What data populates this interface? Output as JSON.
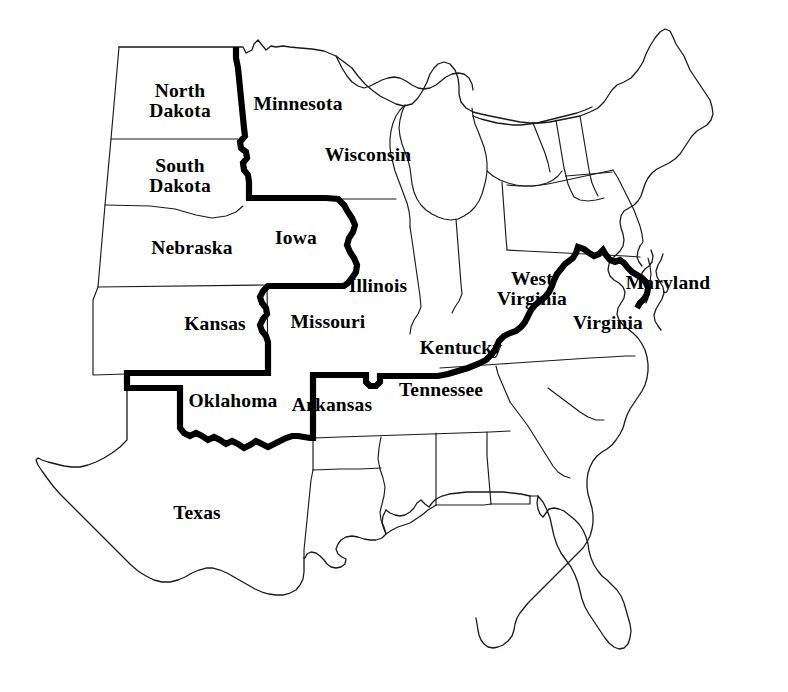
{
  "map": {
    "title": "United States map with bold sectional boundary",
    "description": "Outline map of the eastern and central United States with a heavy black line marking the boundary between the northern and southern states",
    "background_color": "#ffffff",
    "outline_color": "#1a1a1a",
    "bold_line_color": "#000000",
    "bold_line_label": "sectional boundary line",
    "labels": [
      {
        "id": "north-dakota",
        "name": "North Dakota",
        "lines": [
          "North",
          "Dakota"
        ],
        "x": 180,
        "y": 100
      },
      {
        "id": "minnesota",
        "name": "Minnesota",
        "lines": [
          "Minnesota"
        ],
        "x": 298,
        "y": 104
      },
      {
        "id": "south-dakota",
        "name": "South Dakota",
        "lines": [
          "South",
          "Dakota"
        ],
        "x": 180,
        "y": 175
      },
      {
        "id": "wisconsin",
        "name": "Wisconsin",
        "lines": [
          "Wisconsin"
        ],
        "x": 368,
        "y": 155
      },
      {
        "id": "nebraska",
        "name": "Nebraska",
        "lines": [
          "Nebraska"
        ],
        "x": 192,
        "y": 248
      },
      {
        "id": "iowa",
        "name": "Iowa",
        "lines": [
          "Iowa"
        ],
        "x": 296,
        "y": 238
      },
      {
        "id": "illinois",
        "name": "Illinois",
        "lines": [
          "Illinois"
        ],
        "x": 378,
        "y": 286
      },
      {
        "id": "west-virginia",
        "name": "West Virginia",
        "lines": [
          "West",
          "Virginia"
        ],
        "x": 532,
        "y": 288
      },
      {
        "id": "maryland",
        "name": "Maryland",
        "lines": [
          "Maryland"
        ],
        "x": 668,
        "y": 283
      },
      {
        "id": "kansas",
        "name": "Kansas",
        "lines": [
          "Kansas"
        ],
        "x": 215,
        "y": 324
      },
      {
        "id": "missouri",
        "name": "Missouri",
        "lines": [
          "Missouri"
        ],
        "x": 328,
        "y": 322
      },
      {
        "id": "virginia",
        "name": "Virginia",
        "lines": [
          "Virginia"
        ],
        "x": 608,
        "y": 323
      },
      {
        "id": "kentucky",
        "name": "Kentucky",
        "lines": [
          "Kentucky"
        ],
        "x": 461,
        "y": 348
      },
      {
        "id": "oklahoma",
        "name": "Oklahoma",
        "lines": [
          "Oklahoma"
        ],
        "x": 233,
        "y": 401
      },
      {
        "id": "arkansas",
        "name": "Arkansas",
        "lines": [
          "Arkansas"
        ],
        "x": 332,
        "y": 405
      },
      {
        "id": "tennessee",
        "name": "Tennessee",
        "lines": [
          "Tennessee"
        ],
        "x": 441,
        "y": 390
      },
      {
        "id": "texas",
        "name": "Texas",
        "lines": [
          "Texas"
        ],
        "x": 197,
        "y": 513
      }
    ]
  }
}
